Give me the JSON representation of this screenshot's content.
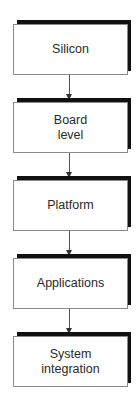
{
  "diagram": {
    "type": "flowchart",
    "direction": "top-to-bottom",
    "nodes": [
      {
        "id": "silicon",
        "label": "Silicon"
      },
      {
        "id": "board",
        "label": "Board\nlevel"
      },
      {
        "id": "platform",
        "label": "Platform"
      },
      {
        "id": "applications",
        "label": "Applications"
      },
      {
        "id": "system",
        "label": "System\nintegration"
      }
    ],
    "edges": [
      {
        "from": "silicon",
        "to": "board"
      },
      {
        "from": "board",
        "to": "platform"
      },
      {
        "from": "platform",
        "to": "applications"
      },
      {
        "from": "applications",
        "to": "system"
      }
    ],
    "colors": {
      "box_border": "#8a8a8a",
      "shadow": "#111111",
      "text": "#2a2a2a",
      "arrow": "#333333"
    }
  }
}
